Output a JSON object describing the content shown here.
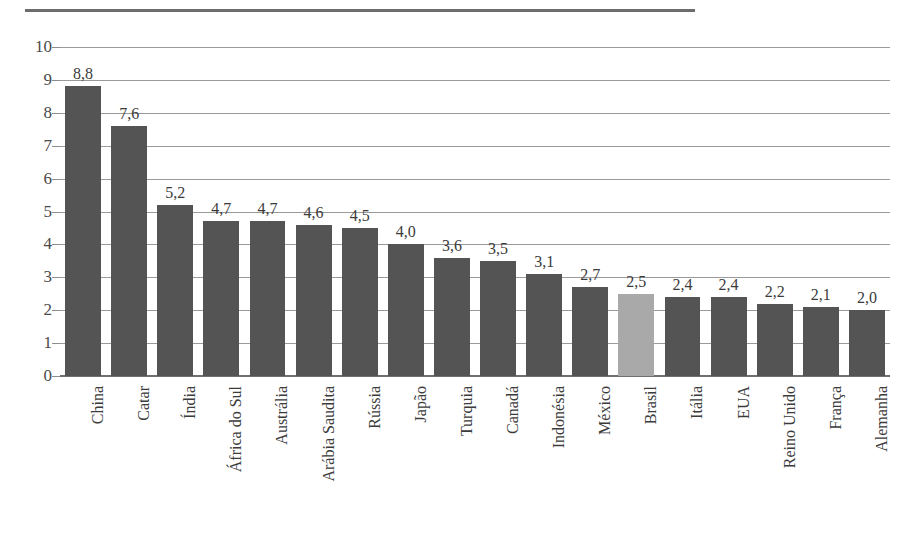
{
  "header": {
    "rule_fragment": "",
    "divider_name": "top-divider"
  },
  "chart_data": {
    "type": "bar",
    "title": "",
    "subtitle": "",
    "xlabel": "",
    "ylabel": "",
    "ylim": [
      0,
      10
    ],
    "grid": true,
    "legend": "none",
    "decimal_separator": ",",
    "categories": [
      "China",
      "Catar",
      "Índia",
      "África do Sul",
      "Austrália",
      "Arábia Saudita",
      "Rússia",
      "Japão",
      "Turquia",
      "Canadá",
      "Indonésia",
      "México",
      "Brasil",
      "Itália",
      "EUA",
      "Reino Unido",
      "França",
      "Alemanha"
    ],
    "values": [
      8.8,
      7.6,
      5.2,
      4.7,
      4.7,
      4.6,
      4.5,
      4.0,
      3.6,
      3.5,
      3.1,
      2.7,
      2.5,
      2.4,
      2.4,
      2.2,
      2.1,
      2.0
    ],
    "value_labels": [
      "8,8",
      "7,6",
      "5,2",
      "4,7",
      "4,7",
      "4,6",
      "4,5",
      "4,0",
      "3,6",
      "3,5",
      "3,1",
      "2,7",
      "2,5",
      "2,4",
      "2,4",
      "2,2",
      "2,1",
      "2,0"
    ],
    "highlight_category": "Brasil",
    "highlight_index": 12,
    "bar_color": "#545454",
    "highlight_color": "#a9a9a9",
    "gridline_color": "#9a9a9a",
    "axis_color": "#6f6f6f",
    "yticks": [
      0,
      1,
      2,
      3,
      4,
      5,
      6,
      7,
      8,
      9,
      10
    ],
    "ytick_labels": [
      "0",
      "1",
      "2",
      "3",
      "4",
      "5",
      "6",
      "7",
      "8",
      "9",
      "10"
    ]
  }
}
